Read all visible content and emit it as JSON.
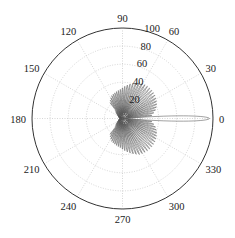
{
  "chart_data": {
    "type": "polar-line",
    "title": "",
    "theta_unit": "degrees",
    "rlim": [
      0,
      100
    ],
    "radial_ticks": [
      20,
      40,
      60,
      80,
      100
    ],
    "radial_tick_labels": [
      "20",
      "40",
      "60",
      "80",
      "100"
    ],
    "angular_ticks": [
      0,
      30,
      60,
      90,
      120,
      150,
      180,
      210,
      240,
      270,
      300,
      330
    ],
    "angular_tick_labels": [
      "0",
      "30",
      "60",
      "90",
      "120",
      "150",
      "180",
      "210",
      "240",
      "270",
      "300",
      "330"
    ],
    "grid": true,
    "legend": null,
    "series": [
      {
        "name": "pattern",
        "color": "#555555",
        "description": "Multi-lobed radiation pattern: narrow main lobe at 0° reaching ~96; fan of ~28 sidelobes spanning roughly 0°–110° and 250°–360°, envelope peaking ~45 near 70°/290°; small back lobes near 120°–240°.",
        "main_lobe": {
          "theta": 0,
          "r": 96
        },
        "envelope": [
          {
            "theta": 5,
            "r": 32
          },
          {
            "theta": 15,
            "r": 38
          },
          {
            "theta": 25,
            "r": 42
          },
          {
            "theta": 35,
            "r": 44
          },
          {
            "theta": 45,
            "r": 45
          },
          {
            "theta": 55,
            "r": 45
          },
          {
            "theta": 65,
            "r": 44
          },
          {
            "theta": 75,
            "r": 40
          },
          {
            "theta": 85,
            "r": 36
          },
          {
            "theta": 95,
            "r": 32
          },
          {
            "theta": 105,
            "r": 30
          },
          {
            "theta": 115,
            "r": 28
          },
          {
            "theta": 125,
            "r": 24
          },
          {
            "theta": 135,
            "r": 18
          },
          {
            "theta": 150,
            "r": 10
          },
          {
            "theta": 180,
            "r": 4
          }
        ]
      }
    ]
  }
}
